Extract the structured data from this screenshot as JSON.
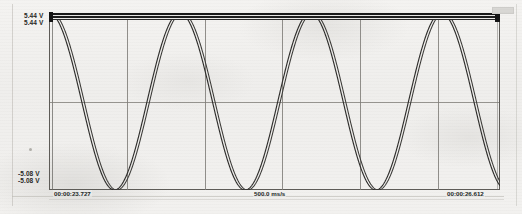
{
  "app": {
    "title": "Waveform Capture",
    "type": "oscilloscope-strip-chart"
  },
  "axes": {
    "y_top_labels": [
      "5.44 V",
      "5.44 V"
    ],
    "y_bottom_labels": [
      "-5.08 V",
      "-5.08 V"
    ],
    "x_left_label": "00:00:23.727",
    "x_center_label": "500.0 ms/s",
    "x_right_label": "00:00:26.612"
  },
  "colors": {
    "background": "#f1f0ee",
    "frame": "#5d5b57",
    "grid": "#7f7d78",
    "trace_a": "#2e2d2b",
    "trace_b": "#3a3936",
    "rail": "#1a1a1a",
    "marker": "#d8d7d4",
    "text": "#272624"
  },
  "chart_data": {
    "type": "line",
    "title": "",
    "subtitle": "",
    "xlabel": "Time",
    "ylabel": "Voltage",
    "xlim": [
      "00:00:23.727",
      "00:00:26.612"
    ],
    "ylim": [
      -5.08,
      5.44
    ],
    "ytick_labels": [
      "5.44 V",
      "-5.08 V"
    ],
    "xtick_labels": [
      "00:00:23.727",
      "500.0 ms/s",
      "00:00:26.612"
    ],
    "grid": true,
    "legend": "none",
    "sweep_rate": "500.0 ms/s",
    "duration_seconds": 2.885,
    "clipping": "both traces saturate/clip at the positive rail (5.44 V) forming a solid band across the full width",
    "series": [
      {
        "name": "Channel A",
        "color": "#2e2d2b",
        "waveform": "sine",
        "amplitude_volts": 5.26,
        "offset_volts": 0.18,
        "cycles_visible": 3.45,
        "phase_degrees": 90,
        "clipped_top_volts": 5.44,
        "min_volts": -5.08
      },
      {
        "name": "Channel B",
        "color": "#3a3936",
        "waveform": "sine",
        "amplitude_volts": 5.26,
        "offset_volts": 0.18,
        "cycles_visible": 3.45,
        "phase_degrees": 83,
        "clipped_top_volts": 5.44,
        "min_volts": -5.08
      }
    ],
    "gridlines": {
      "vertical_count": 6,
      "vertical_x_fraction": [
        0.0,
        0.172,
        0.345,
        0.517,
        0.69,
        0.862,
        1.0
      ],
      "horizontal_count": 1,
      "horizontal_y_value": 0.18
    }
  },
  "marker": {
    "name": "range-indicator",
    "label": ""
  }
}
